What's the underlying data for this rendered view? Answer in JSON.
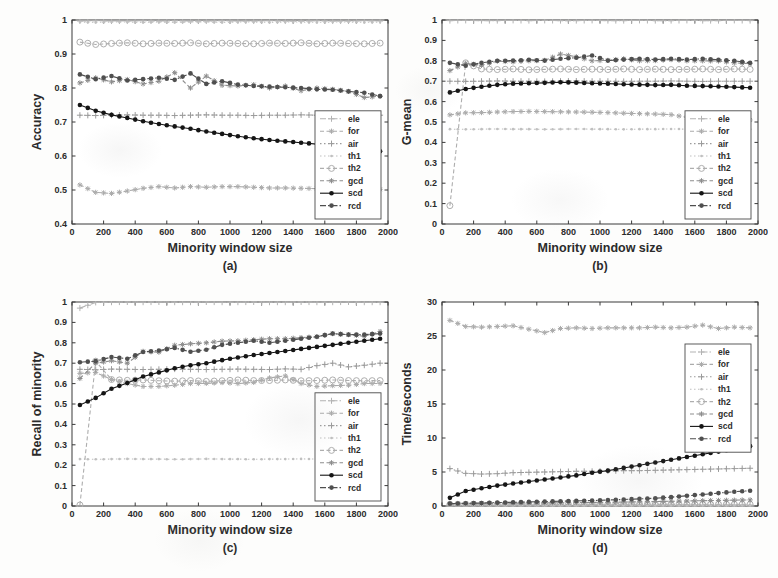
{
  "figure": {
    "background": "#fdfdfc",
    "axis_color": "#3a3a3a",
    "xlabel": "Minority window size",
    "legend_labels": [
      "ele",
      "for",
      "air",
      "th1",
      "th2",
      "gcd",
      "scd",
      "rcd"
    ],
    "x_common": [
      50,
      150,
      250,
      350,
      450,
      550,
      650,
      750,
      850,
      950,
      1050,
      1150,
      1250,
      1350,
      1450,
      1550,
      1650,
      1750,
      1850,
      1950
    ],
    "series_styles": {
      "ele": {
        "color": "#b3b3b3",
        "dash": "6 2 1.5 2",
        "marker": "plus"
      },
      "for": {
        "color": "#ababab",
        "dash": "4 2.5",
        "marker": "star"
      },
      "air": {
        "color": "#9b9b9b",
        "dash": "1.5 2.5",
        "marker": "plus"
      },
      "th1": {
        "color": "#c0c0c0",
        "dash": "1.5 2.5",
        "marker": "dot"
      },
      "th2": {
        "color": "#aeaeae",
        "dash": "4 2.5",
        "marker": "ocircle"
      },
      "gcd": {
        "color": "#8d8d8d",
        "dash": "4 2.5",
        "marker": "star"
      },
      "scd": {
        "color": "#151515",
        "dash": "",
        "marker": "fcircle"
      },
      "rcd": {
        "color": "#4f4f4f",
        "dash": "6 2 1.5 2",
        "marker": "fcircle"
      }
    }
  },
  "chart_data": [
    {
      "id": "a",
      "type": "line",
      "caption": "(a)",
      "xlabel": "Minority window size",
      "ylabel": "Accuracy",
      "xlim": [
        0,
        2000
      ],
      "xticks": [
        0,
        200,
        400,
        600,
        800,
        1000,
        1200,
        1400,
        1600,
        1800,
        2000
      ],
      "ylim": [
        0.4,
        1
      ],
      "yticks": [
        0.4,
        0.5,
        0.6,
        0.7,
        0.8,
        0.9,
        1
      ],
      "grid": false,
      "legend_position": "bottom-right",
      "series": [
        {
          "name": "ele",
          "values": [
            0.997,
            0.998,
            0.997,
            0.997,
            0.998,
            0.997,
            0.998,
            0.997,
            0.997,
            0.998,
            0.997,
            0.997,
            0.998,
            0.997,
            0.997,
            0.998,
            0.997,
            0.997,
            0.998,
            0.997
          ]
        },
        {
          "name": "for",
          "values": [
            0.515,
            0.493,
            0.49,
            0.497,
            0.505,
            0.51,
            0.506,
            0.51,
            0.508,
            0.51,
            0.51,
            0.508,
            0.506,
            0.506,
            0.505,
            0.504,
            0.504,
            0.505,
            0.503,
            0.502
          ]
        },
        {
          "name": "air",
          "values": [
            0.72,
            0.719,
            0.72,
            0.721,
            0.72,
            0.72,
            0.719,
            0.72,
            0.721,
            0.72,
            0.72,
            0.719,
            0.72,
            0.72,
            0.721,
            0.72,
            0.719,
            0.72,
            0.72,
            0.72
          ]
        },
        {
          "name": "th1",
          "values": [
            0.994,
            0.993,
            0.994,
            0.994,
            0.993,
            0.994,
            0.993,
            0.994,
            0.994,
            0.993,
            0.994,
            0.994,
            0.993,
            0.994,
            0.994,
            0.993,
            0.994,
            0.994,
            0.993,
            0.994
          ]
        },
        {
          "name": "th2",
          "values": [
            0.935,
            0.928,
            0.931,
            0.933,
            0.93,
            0.932,
            0.931,
            0.933,
            0.93,
            0.932,
            0.931,
            0.93,
            0.932,
            0.931,
            0.933,
            0.93,
            0.932,
            0.931,
            0.93,
            0.932
          ]
        },
        {
          "name": "gcd",
          "values": [
            0.815,
            0.83,
            0.818,
            0.825,
            0.812,
            0.82,
            0.845,
            0.8,
            0.835,
            0.808,
            0.806,
            0.81,
            0.8,
            0.806,
            0.792,
            0.8,
            0.796,
            0.79,
            0.772,
            0.776
          ]
        },
        {
          "name": "scd",
          "values": [
            0.75,
            0.733,
            0.721,
            0.712,
            0.702,
            0.694,
            0.687,
            0.68,
            0.672,
            0.665,
            0.658,
            0.652,
            0.647,
            0.643,
            0.639,
            0.635,
            0.63,
            0.626,
            0.621,
            0.614
          ]
        },
        {
          "name": "rcd",
          "values": [
            0.84,
            0.826,
            0.835,
            0.822,
            0.826,
            0.83,
            0.824,
            0.843,
            0.812,
            0.82,
            0.81,
            0.806,
            0.804,
            0.802,
            0.8,
            0.796,
            0.795,
            0.79,
            0.786,
            0.776
          ]
        }
      ]
    },
    {
      "id": "b",
      "type": "line",
      "caption": "(b)",
      "xlabel": "Minority window size",
      "ylabel": "G-mean",
      "xlim": [
        0,
        2000
      ],
      "xticks": [
        0,
        200,
        400,
        600,
        800,
        1000,
        1200,
        1400,
        1600,
        1800,
        2000
      ],
      "ylim": [
        0,
        1
      ],
      "yticks": [
        0,
        0.1,
        0.2,
        0.3,
        0.4,
        0.5,
        0.6,
        0.7,
        0.8,
        0.9,
        1
      ],
      "grid": false,
      "legend_position": "bottom-right",
      "series": [
        {
          "name": "ele",
          "values": [
            0.997,
            0.998,
            0.997,
            0.997,
            0.998,
            0.997,
            0.998,
            0.997,
            0.997,
            0.998,
            0.997,
            0.997,
            0.998,
            0.997,
            0.997,
            0.998,
            0.997,
            0.997,
            0.998,
            0.997
          ]
        },
        {
          "name": "for",
          "values": [
            0.535,
            0.545,
            0.546,
            0.549,
            0.551,
            0.552,
            0.551,
            0.55,
            0.549,
            0.548,
            0.546,
            0.543,
            0.541,
            0.539,
            0.536,
            0.523,
            0.516,
            0.512,
            0.511,
            0.51
          ]
        },
        {
          "name": "air",
          "values": [
            0.7,
            0.699,
            0.7,
            0.701,
            0.7,
            0.7,
            0.699,
            0.7,
            0.701,
            0.7,
            0.7,
            0.699,
            0.7,
            0.7,
            0.701,
            0.7,
            0.699,
            0.7,
            0.7,
            0.7
          ]
        },
        {
          "name": "th1",
          "values": [
            0.465,
            0.464,
            0.465,
            0.466,
            0.465,
            0.465,
            0.464,
            0.465,
            0.466,
            0.465,
            0.465,
            0.464,
            0.465,
            0.465,
            0.466,
            0.465,
            0.464,
            0.465,
            0.465,
            0.465
          ]
        },
        {
          "name": "th2",
          "values": [
            0.09,
            0.79,
            0.76,
            0.757,
            0.76,
            0.756,
            0.758,
            0.76,
            0.757,
            0.759,
            0.757,
            0.76,
            0.757,
            0.759,
            0.757,
            0.758,
            0.76,
            0.757,
            0.76,
            0.758
          ]
        },
        {
          "name": "gcd",
          "values": [
            0.752,
            0.788,
            0.778,
            0.798,
            0.795,
            0.8,
            0.802,
            0.833,
            0.82,
            0.8,
            0.802,
            0.81,
            0.8,
            0.801,
            0.806,
            0.8,
            0.8,
            0.799,
            0.79,
            0.786
          ]
        },
        {
          "name": "scd",
          "values": [
            0.645,
            0.662,
            0.673,
            0.682,
            0.688,
            0.69,
            0.692,
            0.695,
            0.693,
            0.69,
            0.688,
            0.685,
            0.683,
            0.681,
            0.682,
            0.678,
            0.676,
            0.674,
            0.671,
            0.668
          ]
        },
        {
          "name": "rcd",
          "values": [
            0.79,
            0.776,
            0.79,
            0.8,
            0.801,
            0.805,
            0.801,
            0.81,
            0.815,
            0.826,
            0.801,
            0.806,
            0.81,
            0.806,
            0.81,
            0.806,
            0.81,
            0.805,
            0.8,
            0.79
          ]
        }
      ]
    },
    {
      "id": "c",
      "type": "line",
      "caption": "(c)",
      "xlabel": "Minority window size",
      "ylabel": "Recall of minority",
      "xlim": [
        0,
        2000
      ],
      "xticks": [
        0,
        200,
        400,
        600,
        800,
        1000,
        1200,
        1400,
        1600,
        1800,
        2000
      ],
      "ylim": [
        0,
        1
      ],
      "yticks": [
        0,
        0.1,
        0.2,
        0.3,
        0.4,
        0.5,
        0.6,
        0.7,
        0.8,
        0.9,
        1
      ],
      "grid": false,
      "legend_position": "bottom-right",
      "series": [
        {
          "name": "ele",
          "values": [
            0.97,
            0.998,
            0.999,
            1.0,
            0.999,
            1.0,
            0.999,
            0.999,
            1.0,
            0.999,
            0.999,
            1.0,
            0.999,
            0.999,
            1.0,
            0.999,
            0.999,
            1.0,
            0.999,
            0.999
          ]
        },
        {
          "name": "for",
          "values": [
            0.65,
            0.655,
            0.62,
            0.6,
            0.586,
            0.586,
            0.592,
            0.6,
            0.601,
            0.605,
            0.6,
            0.606,
            0.628,
            0.638,
            0.6,
            0.586,
            0.59,
            0.592,
            0.6,
            0.601
          ]
        },
        {
          "name": "air",
          "values": [
            0.67,
            0.668,
            0.671,
            0.67,
            0.669,
            0.67,
            0.671,
            0.67,
            0.669,
            0.67,
            0.671,
            0.67,
            0.669,
            0.672,
            0.67,
            0.688,
            0.7,
            0.682,
            0.69,
            0.7
          ]
        },
        {
          "name": "th1",
          "values": [
            0.23,
            0.229,
            0.23,
            0.231,
            0.23,
            0.23,
            0.229,
            0.23,
            0.231,
            0.23,
            0.23,
            0.229,
            0.23,
            0.23,
            0.231,
            0.23,
            0.229,
            0.23,
            0.23,
            0.23
          ]
        },
        {
          "name": "th2",
          "values": [
            0.005,
            0.71,
            0.62,
            0.616,
            0.618,
            0.614,
            0.612,
            0.615,
            0.611,
            0.614,
            0.618,
            0.615,
            0.615,
            0.618,
            0.614,
            0.615,
            0.618,
            0.615,
            0.614,
            0.615
          ]
        },
        {
          "name": "gcd",
          "values": [
            0.625,
            0.7,
            0.712,
            0.7,
            0.758,
            0.754,
            0.788,
            0.795,
            0.8,
            0.808,
            0.81,
            0.815,
            0.82,
            0.82,
            0.825,
            0.83,
            0.845,
            0.84,
            0.832,
            0.855
          ]
        },
        {
          "name": "scd",
          "values": [
            0.495,
            0.53,
            0.575,
            0.603,
            0.635,
            0.655,
            0.675,
            0.69,
            0.7,
            0.715,
            0.728,
            0.74,
            0.75,
            0.76,
            0.77,
            0.78,
            0.79,
            0.8,
            0.81,
            0.82
          ]
        },
        {
          "name": "rcd",
          "values": [
            0.705,
            0.71,
            0.73,
            0.722,
            0.755,
            0.762,
            0.775,
            0.756,
            0.766,
            0.79,
            0.8,
            0.81,
            0.8,
            0.81,
            0.82,
            0.83,
            0.845,
            0.84,
            0.84,
            0.845
          ]
        }
      ]
    },
    {
      "id": "d",
      "type": "line",
      "caption": "(d)",
      "xlabel": "Minority window size",
      "ylabel": "Time/seconds",
      "xlim": [
        0,
        2000
      ],
      "xticks": [
        0,
        200,
        400,
        600,
        800,
        1000,
        1200,
        1400,
        1600,
        1800,
        2000
      ],
      "ylim": [
        0,
        30
      ],
      "yticks": [
        0,
        5,
        10,
        15,
        20,
        25,
        30
      ],
      "grid": false,
      "legend_position": "top-right",
      "series": [
        {
          "name": "ele",
          "values": [
            0.15,
            0.16,
            0.15,
            0.14,
            0.15,
            0.16,
            0.15,
            0.15,
            0.14,
            0.15,
            0.16,
            0.15,
            0.15,
            0.14,
            0.15,
            0.16,
            0.15,
            0.14,
            0.15,
            0.15
          ]
        },
        {
          "name": "for",
          "values": [
            27.3,
            26.4,
            26.3,
            26.4,
            26.5,
            26.0,
            25.5,
            26.1,
            26.2,
            26.1,
            26.2,
            26.2,
            26.2,
            26.3,
            26.2,
            26.3,
            26.6,
            26.1,
            26.3,
            26.2
          ]
        },
        {
          "name": "air",
          "values": [
            5.5,
            4.8,
            4.7,
            4.75,
            4.9,
            4.95,
            5.0,
            5.05,
            5.1,
            5.1,
            5.15,
            5.2,
            5.2,
            5.25,
            5.3,
            5.35,
            5.4,
            5.45,
            5.5,
            5.55
          ]
        },
        {
          "name": "th1",
          "values": [
            0.08,
            0.08,
            0.08,
            0.08,
            0.08,
            0.08,
            0.08,
            0.08,
            0.08,
            0.08,
            0.08,
            0.08,
            0.08,
            0.08,
            0.08,
            0.08,
            0.08,
            0.08,
            0.08,
            0.08
          ]
        },
        {
          "name": "th2",
          "values": [
            0.25,
            0.25,
            0.25,
            0.25,
            0.25,
            0.25,
            0.25,
            0.25,
            0.25,
            0.25,
            0.25,
            0.25,
            0.25,
            0.25,
            0.25,
            0.25,
            0.25,
            0.25,
            0.25,
            0.25
          ]
        },
        {
          "name": "gcd",
          "values": [
            0.3,
            0.34,
            0.36,
            0.4,
            0.42,
            0.44,
            0.46,
            0.48,
            0.5,
            0.52,
            0.55,
            0.58,
            0.62,
            0.66,
            0.7,
            0.74,
            0.78,
            0.82,
            0.86,
            0.9
          ]
        },
        {
          "name": "scd",
          "values": [
            1.2,
            2.2,
            2.6,
            3.0,
            3.3,
            3.6,
            3.9,
            4.2,
            4.5,
            4.9,
            5.2,
            5.6,
            6.0,
            6.4,
            6.8,
            7.2,
            7.6,
            8.0,
            8.4,
            8.8
          ]
        },
        {
          "name": "rcd",
          "values": [
            0.35,
            0.4,
            0.45,
            0.5,
            0.55,
            0.6,
            0.65,
            0.7,
            0.75,
            0.8,
            0.88,
            0.96,
            1.05,
            1.15,
            1.3,
            1.5,
            1.7,
            1.9,
            2.1,
            2.25
          ]
        }
      ]
    }
  ]
}
